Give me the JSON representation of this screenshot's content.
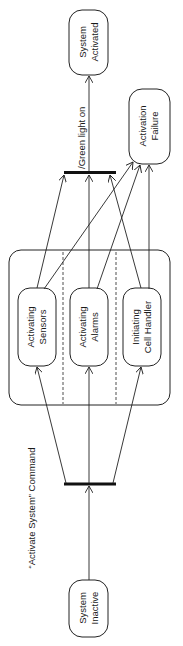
{
  "diagram": {
    "type": "uml-state-diagram",
    "orientation": "rotated-90-ccw",
    "colors": {
      "stroke": "#222222",
      "text": "#1a1a1a",
      "background": "#ffffff"
    },
    "states": {
      "system_inactive": {
        "line1": "System",
        "line2": "Inactive"
      },
      "system_activated": {
        "line1": "System",
        "line2": "Activated"
      },
      "activation_failure": {
        "line1": "Activation",
        "line2": "Failure"
      },
      "activating_sensors": {
        "line1": "Activating",
        "line2": "Sensors"
      },
      "activating_alarms": {
        "line1": "Activating",
        "line2": "Alarms"
      },
      "initiating_cell_handler": {
        "line1": "Initiating",
        "line2": "Cell Handler"
      }
    },
    "transitions": {
      "activate_command": "“Activate System” Command",
      "green_light": "/Green light on"
    },
    "composite_state": {
      "regions": 3
    },
    "sync_bars": [
      "fork",
      "join"
    ]
  }
}
